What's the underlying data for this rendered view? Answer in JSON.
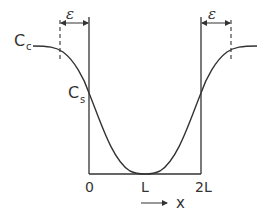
{
  "diagram": {
    "type": "concentration-profile",
    "labels": {
      "c_c_main": "C",
      "c_c_sub": "c",
      "c_s_main": "C",
      "c_s_sub": "s",
      "epsilon_left": "ε",
      "epsilon_right": "ε",
      "tick_0": "0",
      "tick_L": "L",
      "tick_2L": "2L",
      "axis_x": "x"
    },
    "colors": {
      "stroke": "#333333",
      "background": "#ffffff"
    }
  }
}
